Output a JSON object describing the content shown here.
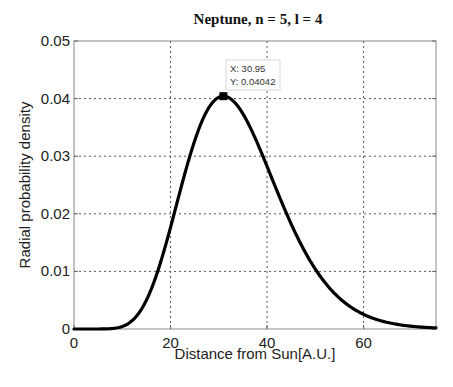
{
  "chart_data": {
    "type": "line",
    "title": "Neptune, n = 5, l = 4",
    "xlabel": "Distance from Sun[A.U.]",
    "ylabel": "Radial probability density",
    "xlim": [
      0,
      75
    ],
    "ylim": [
      0,
      0.05
    ],
    "xticks": [
      0,
      20,
      40,
      60
    ],
    "xtick_labels": [
      "0",
      "20",
      "40",
      "60"
    ],
    "yticks": [
      0,
      0.01,
      0.02,
      0.03,
      0.04,
      0.05
    ],
    "ytick_labels": [
      "0",
      "0.01",
      "0.02",
      "0.03",
      "0.04",
      "0.05"
    ],
    "grid": true,
    "legend": null,
    "series": [
      {
        "name": "radial probability density",
        "color": "#000000",
        "x": [
          0,
          5,
          8,
          10,
          12.5,
          15,
          17.5,
          20,
          22.5,
          25,
          27.5,
          30.95,
          35,
          40,
          45,
          50,
          55,
          60,
          65,
          70,
          75
        ],
        "y": [
          0,
          2e-06,
          8e-05,
          0.00044,
          0.00181,
          0.005,
          0.0104,
          0.0177,
          0.0256,
          0.0327,
          0.0378,
          0.04042,
          0.0374,
          0.0282,
          0.0182,
          0.0104,
          0.00536,
          0.00254,
          0.00112,
          0.00047,
          0.00019
        ]
      }
    ],
    "annotations": [
      {
        "type": "datatip",
        "x": 30.95,
        "y": 0.04042,
        "line1": "X: 30.95",
        "line2": "Y: 0.04042"
      }
    ]
  }
}
